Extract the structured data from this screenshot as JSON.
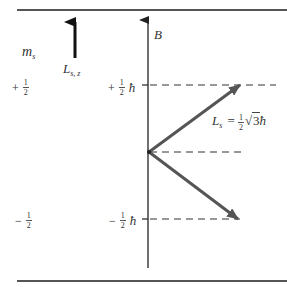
{
  "diagram": {
    "type": "spin-angular-momentum-vector-diagram",
    "colors": {
      "rule": "#555555",
      "axis": "#222222",
      "vector": "#555555",
      "dash": "#333333",
      "text": "#333333"
    },
    "column_header": {
      "symbol": "m",
      "subscript": "s"
    },
    "reference_arrow": {
      "label_main": "L",
      "label_sub": "s, z"
    },
    "axis": {
      "label": "B"
    },
    "levels": [
      {
        "ms_sign": "+",
        "ms_num": "1",
        "ms_den": "2",
        "value_sign": "+",
        "value_num": "1",
        "value_den": "2",
        "unit": "ħ"
      },
      {
        "ms_sign": "−",
        "ms_num": "1",
        "ms_den": "2",
        "value_sign": "−",
        "value_num": "1",
        "value_den": "2",
        "unit": "ħ"
      }
    ],
    "magnitude_label": {
      "lhs_main": "L",
      "lhs_sub": "s",
      "equals": "=",
      "coef_num": "1",
      "coef_den": "2",
      "radical": "√",
      "radicand": "3",
      "unit": "ħ"
    }
  }
}
